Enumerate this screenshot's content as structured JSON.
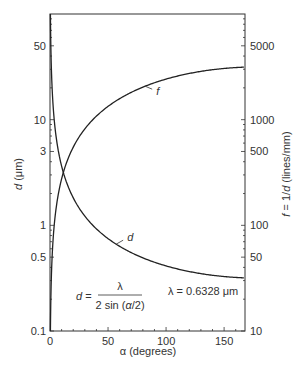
{
  "chart_data": {
    "type": "line",
    "title": "",
    "xlabel": "α (degrees)",
    "ylabel_left": "d (μm)",
    "ylabel_right": "f = 1/d (lines/mm)",
    "xlim": [
      0,
      168
    ],
    "ylim_left": [
      0.1,
      100
    ],
    "ylim_right": [
      10,
      10000
    ],
    "yscale": "log",
    "grid": false,
    "x_ticks": [
      0,
      50,
      100,
      150
    ],
    "x_tick_labels": [
      "0",
      "50",
      "100",
      "150"
    ],
    "y_left_tick_labels": [
      {
        "label": "50",
        "value": 50
      },
      {
        "label": "10",
        "value": 10
      },
      {
        "label": "3",
        "value": 5
      },
      {
        "label": "1",
        "value": 1
      },
      {
        "label": "0.5",
        "value": 0.5
      },
      {
        "label": "0.1",
        "value": 0.1
      }
    ],
    "y_right_tick_labels": [
      {
        "label": "5000",
        "value": 5000
      },
      {
        "label": "1000",
        "value": 1000
      },
      {
        "label": "500",
        "value": 500
      },
      {
        "label": "100",
        "value": 100
      },
      {
        "label": "50",
        "value": 50
      },
      {
        "label": "10",
        "value": 10
      }
    ],
    "series": [
      {
        "name": "d",
        "axis": "left",
        "unit": "μm",
        "x": [
          0.5,
          1,
          2,
          3,
          5,
          8,
          11.5,
          15,
          20,
          30,
          40,
          50,
          60,
          70,
          80,
          90,
          100,
          110,
          120,
          130,
          140,
          150,
          160,
          168
        ],
        "values": [
          72.5,
          36.3,
          18.1,
          12.1,
          7.25,
          4.53,
          3.16,
          2.42,
          1.82,
          1.22,
          0.925,
          0.749,
          0.633,
          0.552,
          0.492,
          0.447,
          0.413,
          0.386,
          0.365,
          0.349,
          0.337,
          0.328,
          0.321,
          0.318
        ]
      },
      {
        "name": "f",
        "axis": "right",
        "unit": "lines/mm",
        "x": [
          0.5,
          1,
          2,
          3,
          5,
          8,
          11.5,
          15,
          20,
          30,
          40,
          50,
          60,
          70,
          80,
          90,
          100,
          110,
          120,
          130,
          140,
          150,
          160,
          168
        ],
        "values": [
          13.8,
          27.6,
          55.2,
          82.7,
          138,
          220,
          316,
          413,
          549,
          818,
          1081,
          1336,
          1580,
          1812,
          2032,
          2235,
          2421,
          2592,
          2737,
          2866,
          2970,
          3053,
          3114,
          3146
        ]
      }
    ],
    "curve_labels": [
      {
        "text": "f",
        "x": 82,
        "series": "f"
      },
      {
        "text": "d",
        "x": 57,
        "series": "d"
      }
    ],
    "annotations": {
      "formula_lhs": "d =",
      "formula_num": "λ",
      "formula_den": "2 sin (α/2)",
      "wavelength": "λ = 0.6328 μm"
    }
  }
}
